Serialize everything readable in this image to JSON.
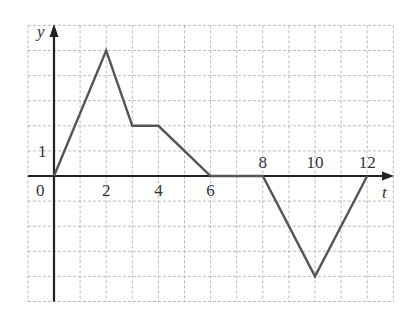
{
  "chart_data": {
    "type": "line",
    "title": "",
    "xlabel": "t",
    "ylabel": "y",
    "x": [
      0,
      2,
      3,
      4,
      6,
      8,
      10,
      12
    ],
    "series": [
      {
        "name": "y(t)",
        "values": [
          0,
          5,
          2,
          2,
          0,
          0,
          -4,
          0
        ]
      }
    ],
    "xlim": [
      -1,
      13
    ],
    "ylim": [
      -5,
      5
    ],
    "x_tick_labels": [
      "0",
      "2",
      "4",
      "6",
      "8",
      "10",
      "12"
    ],
    "y_tick_labels": [
      "1"
    ],
    "grid": true,
    "grid_style": "dashed",
    "grid_step_x": 1,
    "grid_step_y": 1,
    "legend": "none",
    "colors": {
      "line": "#555555",
      "axis": "#222222",
      "grid": "#aaaaaa"
    }
  },
  "labels": {
    "origin": "0",
    "x_axis": "t",
    "y_axis": "y"
  }
}
